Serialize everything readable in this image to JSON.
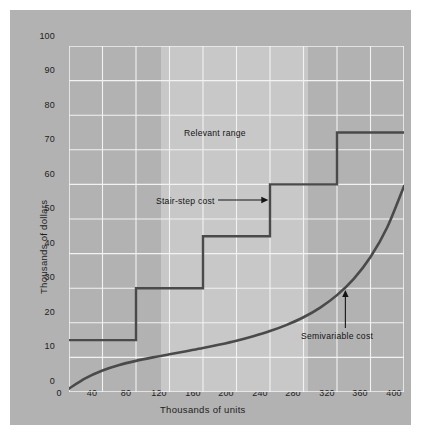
{
  "figure": {
    "panel_color": "#b2b2b2",
    "band_color": "#c8c8c8",
    "grid_color": "#f2f2f2",
    "line_color": "#4a4a4a",
    "text_color": "#1d1d1d"
  },
  "chart_data": {
    "type": "line",
    "title": "",
    "xlabel": "Thousands of units",
    "ylabel": "Thousands of dollars",
    "xlim": [
      0,
      400
    ],
    "ylim": [
      0,
      100
    ],
    "xticks": [
      0,
      40,
      80,
      120,
      160,
      200,
      240,
      280,
      320,
      360,
      400
    ],
    "yticks": [
      0,
      10,
      20,
      30,
      40,
      50,
      60,
      70,
      80,
      90,
      100
    ],
    "grid": true,
    "legend": "none",
    "shaded_regions": [
      {
        "name": "Relevant range",
        "x_start": 110,
        "x_end": 285,
        "color": "#c8c8c8"
      }
    ],
    "series": [
      {
        "name": "Stair-step cost",
        "type": "step",
        "steps": [
          {
            "x_start": 0,
            "x_end": 80,
            "y": 15
          },
          {
            "x_start": 80,
            "x_end": 160,
            "y": 30
          },
          {
            "x_start": 160,
            "x_end": 240,
            "y": 45
          },
          {
            "x_start": 240,
            "x_end": 320,
            "y": 60
          },
          {
            "x_start": 320,
            "x_end": 400,
            "y": 75
          }
        ]
      },
      {
        "name": "Semivariable cost",
        "type": "curve",
        "x": [
          0,
          20,
          40,
          60,
          80,
          100,
          120,
          140,
          160,
          180,
          200,
          220,
          240,
          260,
          280,
          300,
          320,
          340,
          360,
          380,
          400
        ],
        "y": [
          1.0,
          4.0,
          6.2,
          7.8,
          9.0,
          10.0,
          10.9,
          11.8,
          12.7,
          13.7,
          14.8,
          16.1,
          17.6,
          19.4,
          21.6,
          24.4,
          28.0,
          32.7,
          39.0,
          47.6,
          59.5
        ]
      }
    ],
    "annotations": [
      {
        "name": "relevant-range-label",
        "text": "Relevant range",
        "x": 197,
        "y": 80
      },
      {
        "name": "stair-step-label",
        "text": "Stair-step cost",
        "x": 186,
        "y": 55,
        "arrow": "right"
      },
      {
        "name": "semivariable-label",
        "text": "Semivariable cost",
        "x": 345,
        "y": 17,
        "arrow": "up"
      }
    ]
  }
}
